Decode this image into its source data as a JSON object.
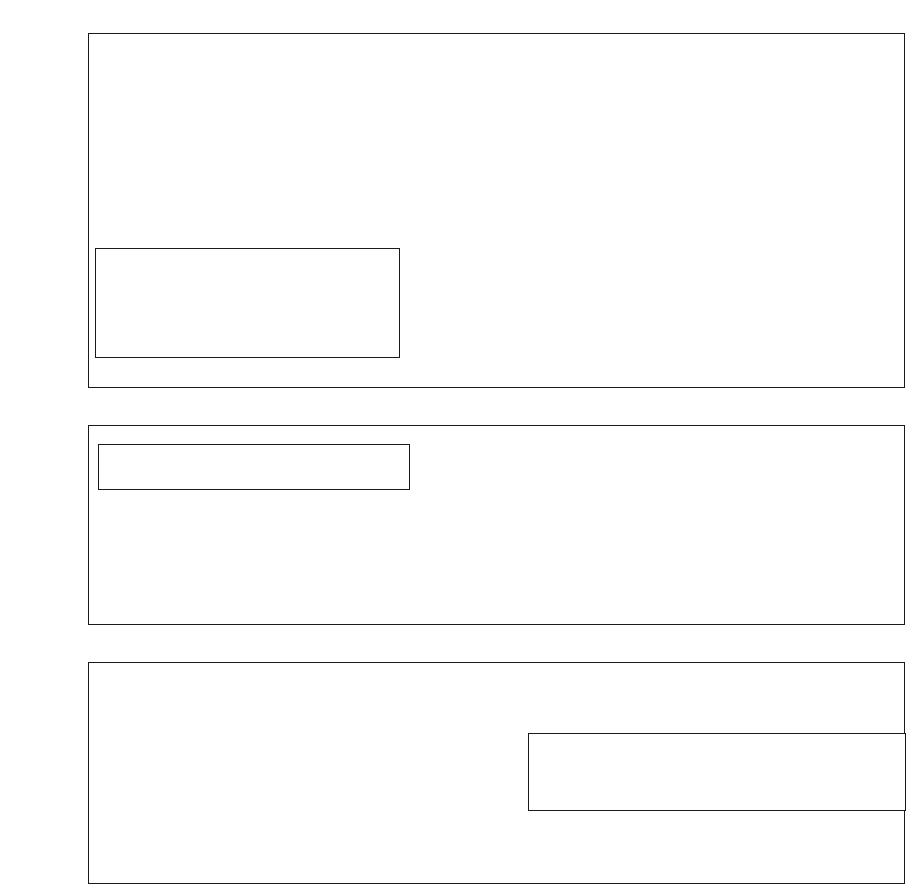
{
  "figure": {
    "shaded_region": {
      "label": "Crisis period",
      "start": "1996.5",
      "end": "1998.4"
    },
    "shade_color": "#d2d2d2",
    "line_color": "#1a1a1a",
    "background": "#ffffff"
  },
  "chart_data": [
    {
      "type": "line",
      "title": "",
      "xlabel": "",
      "ylabel": "",
      "grid": true,
      "legend_position": "inside-left-lower",
      "xlim": [
        1993.5,
        2003.6
      ],
      "ylim": [
        -84,
        24
      ],
      "ytick_labels": [
        "24%",
        "12%",
        "0%",
        "-12%",
        "-24%",
        "-36%",
        "-48%",
        "-60%",
        "-72%",
        "-84%"
      ],
      "ytick_values": [
        24,
        12,
        0,
        -12,
        -24,
        -36,
        -48,
        -60,
        -72,
        -84
      ],
      "xtick_labels": [
        "1994",
        "1995",
        "1996",
        "1997",
        "1998",
        "1999",
        "2000",
        "2001",
        "2002",
        "2003"
      ],
      "xtick_values": [
        1994,
        1995,
        1996,
        1997,
        1998,
        1999,
        2000,
        2001,
        2002,
        2003
      ],
      "x": [
        1993.6,
        1993.85,
        1994.1,
        1994.35,
        1994.6,
        1994.85,
        1995.1,
        1995.35,
        1995.6,
        1995.85,
        1996.1,
        1996.35,
        1996.6,
        1996.85,
        1997.1,
        1997.35,
        1997.6,
        1997.85,
        1998.1,
        1998.35,
        1998.6,
        1998.85,
        1999.1,
        1999.35,
        1999.6,
        1999.85,
        2000.1,
        2000.35,
        2000.6,
        2000.85,
        2001.1,
        2001.35,
        2001.6,
        2001.85,
        2002.1,
        2002.35,
        2002.6,
        2002.85,
        2003.1,
        2003.35
      ],
      "series": [
        {
          "name": "GDP",
          "marker": "square",
          "dash": "solid",
          "values": [
            -19,
            -18,
            -15,
            -12,
            -10.5,
            -8,
            -7,
            -7,
            -6,
            -4,
            -2,
            -1,
            -1,
            -2,
            -2,
            -1,
            -1,
            -3,
            -6,
            -9,
            -14,
            -15,
            -14,
            -13,
            -13,
            -11,
            -9,
            -8,
            -6,
            -5,
            -4,
            -4,
            -3,
            -3,
            -2,
            -1,
            1,
            3,
            6,
            9,
            11
          ]
        },
        {
          "name": "Fixed investment",
          "marker": "circle",
          "dash": "dashed",
          "values": [
            -19,
            -17.5,
            -14,
            -11,
            -2,
            -5,
            -7,
            -7,
            -6,
            -5,
            -3,
            -1,
            -1,
            7,
            -1,
            -8,
            -13,
            -15,
            -30,
            -45,
            -53,
            -53,
            -53,
            -55,
            -53,
            -53,
            -47,
            -54,
            -53,
            -51,
            -49,
            -48,
            -47,
            -46,
            -46,
            -44,
            -44,
            -43,
            -42,
            -38,
            -36,
            -30
          ]
        },
        {
          "name": "Government expenditure",
          "marker": "triangle",
          "dash": "solid",
          "values": [
            -20,
            -19,
            -16,
            -13.5,
            -11,
            -9,
            -7,
            -6,
            -4,
            -3,
            -1,
            0,
            1,
            4,
            5,
            5,
            5,
            5,
            3,
            -1,
            -3,
            -3,
            -1,
            1,
            3,
            5,
            7,
            9,
            9,
            10,
            10,
            11,
            12,
            12,
            13,
            12,
            13,
            14,
            15,
            16,
            18,
            21
          ]
        },
        {
          "name": "Construction",
          "marker": "diamond",
          "dash": "solid",
          "values": [
            0,
            1,
            3,
            6,
            7,
            7,
            8,
            9,
            12,
            13,
            12,
            6,
            0,
            -1,
            -12,
            -38,
            -37,
            -46,
            -55,
            -65,
            -74,
            -79,
            -79,
            -79,
            -79,
            -79,
            -79,
            -81,
            -80,
            -77,
            -74,
            -74,
            -73,
            -74,
            -73,
            -71,
            -70,
            -68,
            -65,
            -62,
            -58,
            -56
          ]
        }
      ]
    },
    {
      "type": "line",
      "title": "",
      "xlabel": "",
      "ylabel": "",
      "grid": true,
      "legend_position": "inside-upper-left",
      "xlim": [
        1993.5,
        2003.6
      ],
      "ylim": [
        10,
        60
      ],
      "ytick_labels": [
        "60",
        "50",
        "40",
        "30",
        "20",
        "10"
      ],
      "ytick_values": [
        60,
        50,
        40,
        30,
        20,
        10
      ],
      "series": [
        {
          "name": "Thai baht per U.S. dollar",
          "marker": "small-triangle",
          "dash": "solid",
          "values": [
            25.2,
            25.2,
            25.1,
            25.1,
            25.1,
            25.0,
            25.0,
            24.9,
            24.9,
            24.9,
            24.9,
            24.8,
            24.8,
            24.8,
            24.9,
            24.8,
            24.7,
            24.6,
            24.6,
            24.7,
            24.8,
            24.8,
            24.8,
            24.9,
            24.9,
            24.8,
            24.8,
            24.9,
            25.0,
            25.0,
            25.1,
            25.0,
            25.0,
            25.1,
            25.2,
            25.3,
            25.4,
            25.5,
            23.5,
            29.8,
            33.5,
            37.8,
            44.5,
            52.0,
            45.0,
            41.0,
            39.0,
            38.6,
            41.0,
            41.3,
            40.0,
            36.3,
            35.3,
            36.0,
            36.8,
            37.3,
            37.9,
            38.0,
            39.0,
            38.0,
            37.5,
            38.8,
            40.0,
            42.5,
            43.3,
            43.0,
            44.3,
            44.6,
            44.2,
            43.5,
            43.0,
            43.1,
            43.2,
            43.0,
            42.4,
            41.5,
            41.0,
            42.4,
            43.0,
            42.6,
            42.4,
            42.4,
            42.0,
            41.5,
            41.0,
            40.3,
            39.0,
            38.8,
            38.8
          ]
        }
      ]
    },
    {
      "type": "line",
      "title": "",
      "xlabel": "",
      "ylabel": "",
      "grid": true,
      "legend_position": "inside-lower-right",
      "xlim": [
        1993.5,
        2003.6
      ],
      "ylim": [
        -0.2,
        0.8
      ],
      "ytick_labels": [
        "0.8",
        "0.6",
        "0.4",
        "0.2",
        "0.0",
        "-0.2"
      ],
      "ytick_values": [
        0.8,
        0.6,
        0.4,
        0.2,
        0.0,
        -0.2
      ],
      "series": [
        {
          "name": "Current Account as a percentage of GDP",
          "marker": "diamond",
          "dash": "solid",
          "values": [
            -0.05,
            -0.07,
            -0.05,
            -0.06,
            -0.07,
            -0.09,
            -0.08,
            -0.1,
            -0.09,
            -0.11,
            -0.08,
            -0.07,
            -0.07,
            -0.06,
            -0.04,
            0.02,
            0.09,
            0.15,
            0.1,
            0.11,
            0.11,
            0.11,
            0.07,
            0.09,
            0.05,
            0.04,
            0.05,
            0.06,
            0.05,
            0.04,
            0.02,
            0.03,
            0.04,
            0.04,
            0.03,
            0.01,
            0.02,
            0.03,
            0.0,
            0.01,
            0.01
          ]
        },
        {
          "name": "Exports as a percentage of GDP",
          "marker": "square",
          "dash": "dotted",
          "values": [
            0.39,
            0.4,
            0.41,
            0.41,
            0.42,
            0.42,
            0.42,
            0.41,
            0.42,
            0.41,
            0.44,
            0.42,
            0.38,
            0.4,
            0.41,
            0.41,
            0.42,
            0.41,
            0.42,
            0.44,
            0.48,
            0.58,
            0.64,
            0.6,
            0.56,
            0.58,
            0.57,
            0.55,
            0.54,
            0.53,
            0.54,
            0.56,
            0.57,
            0.61,
            0.61,
            0.62,
            0.66,
            0.73,
            0.67,
            0.65,
            0.65,
            0.66,
            0.63,
            0.61,
            0.61,
            0.6,
            0.61,
            0.63,
            0.66,
            0.61,
            0.63,
            0.67
          ]
        },
        {
          "name": "Imports as a percentage of GDP",
          "marker": "triangle",
          "dash": "dashed",
          "values": [
            0.42,
            0.41,
            0.45,
            0.44,
            0.47,
            0.48,
            0.48,
            0.48,
            0.51,
            0.47,
            0.46,
            0.47,
            0.43,
            0.44,
            0.44,
            0.44,
            0.44,
            0.41,
            0.43,
            0.44,
            0.44,
            0.49,
            0.5,
            0.48,
            0.45,
            0.45,
            0.43,
            0.42,
            0.41,
            0.38,
            0.36,
            0.42,
            0.45,
            0.46,
            0.48,
            0.51,
            0.51,
            0.57,
            0.55,
            0.53,
            0.52,
            0.53,
            0.52,
            0.51,
            0.53,
            0.53,
            0.54,
            0.55,
            0.56,
            0.55,
            0.57,
            0.58
          ]
        }
      ]
    }
  ]
}
